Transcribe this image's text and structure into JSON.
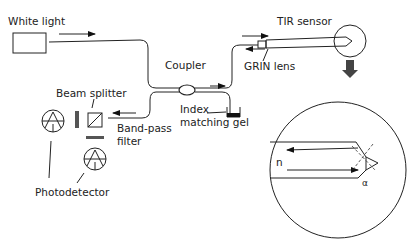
{
  "diagram": {
    "labels": {
      "white_light": "White light",
      "coupler": "Coupler",
      "tir_sensor": "TIR sensor",
      "grin_lens": "GRIN lens",
      "beam_splitter": "Beam splitter",
      "band_pass_line1": "Band-pass",
      "band_pass_line2": "filter",
      "index_line1": "Index",
      "index_line2": "matching gel",
      "photodetector": "Photodetector",
      "refractive_index": "n",
      "angle": "α"
    },
    "colors": {
      "stroke": "#222222",
      "background": "#ffffff",
      "zoom_arrow": "#444444"
    }
  }
}
